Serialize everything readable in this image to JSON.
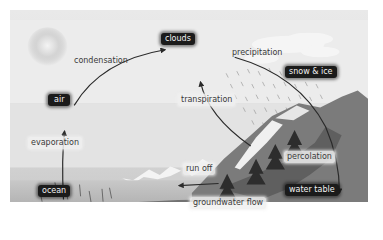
{
  "diagram": {
    "colors": {
      "sky": "#e6e6e6",
      "ocean": "#bdbdbd",
      "ground": "#6e6e6e",
      "mountain": "#7a7a7a",
      "label_dark_bg": "#1b1b1b",
      "label_light_bg": "#efefef",
      "arrow": "#2a2a2a"
    },
    "nodes": {
      "clouds": "clouds",
      "air": "air",
      "ocean": "ocean",
      "snow_ice": "snow & ice",
      "water_table": "water table"
    },
    "processes": {
      "condensation": "condensation",
      "precipitation": "precipitation",
      "transpiration": "transpiration",
      "evaporation": "evaporation",
      "run_off": "run off",
      "percolation": "percolation",
      "groundwater_flow": "groundwater flow"
    },
    "edges": [
      {
        "from": "air",
        "to": "clouds",
        "label": "condensation"
      },
      {
        "from": "clouds",
        "to": "water table",
        "label": "precipitation"
      },
      {
        "from": "mountain trees",
        "to": "clouds",
        "label": "transpiration"
      },
      {
        "from": "ocean",
        "to": "air",
        "label": "evaporation"
      },
      {
        "from": "mountain",
        "to": "ocean",
        "label": "run off"
      },
      {
        "from": "precipitation",
        "to": "water table",
        "label": "percolation"
      },
      {
        "from": "water table",
        "to": "ocean",
        "label": "groundwater flow"
      }
    ]
  }
}
